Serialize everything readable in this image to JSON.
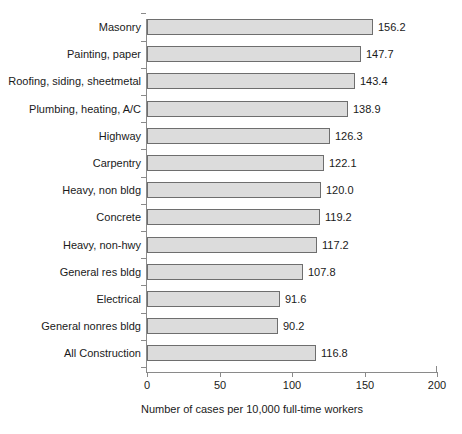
{
  "chart_data": {
    "type": "bar",
    "orientation": "horizontal",
    "title": "",
    "subtitle": "",
    "xlabel": "Number of cases per 10,000 full-time workers",
    "ylabel": "",
    "xlim": [
      0,
      200
    ],
    "xticks": [
      0,
      50,
      100,
      150,
      200
    ],
    "xtick_labels": [
      "0",
      "50",
      "100",
      "150",
      "200"
    ],
    "grid": false,
    "legend": null,
    "bar_color": "#dcdcdc",
    "bar_edge_color": "#6e6e6e",
    "axis_color": "#8a8a8a",
    "value_label_format": "one-decimal",
    "categories": [
      "Masonry",
      "Painting, paper",
      "Roofing, siding, sheetmetal",
      "Plumbing, heating, A/C",
      "Highway",
      "Carpentry",
      "Heavy, non bldg",
      "Concrete",
      "Heavy, non-hwy",
      "General res bldg",
      "Electrical",
      "General nonres bldg",
      "All Construction"
    ],
    "values": [
      156.2,
      147.7,
      143.4,
      138.9,
      126.3,
      122.1,
      120.0,
      119.2,
      117.2,
      107.8,
      91.6,
      90.2,
      116.8
    ],
    "value_labels": [
      "156.2",
      "147.7",
      "143.4",
      "138.9",
      "126.3",
      "122.1",
      "120.0",
      "119.2",
      "117.2",
      "107.8",
      "91.6",
      "90.2",
      "116.8"
    ]
  }
}
